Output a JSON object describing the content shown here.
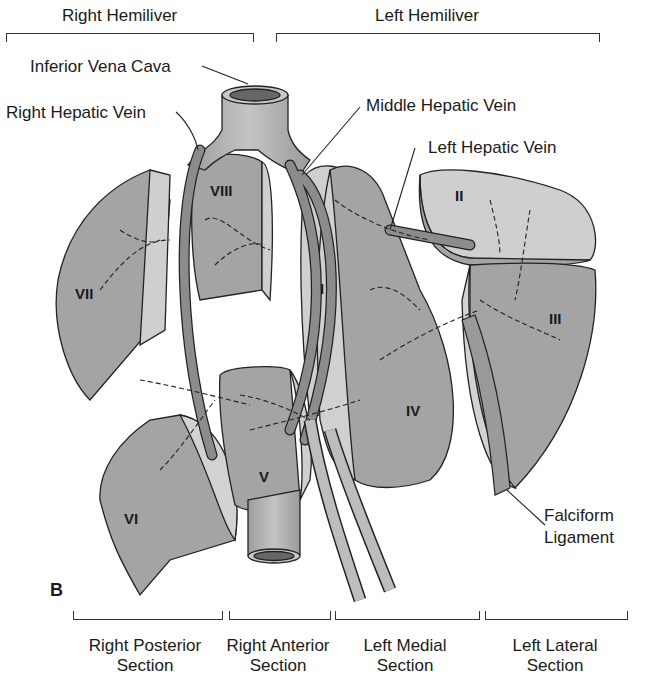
{
  "figure": {
    "panel_label": "B",
    "top_groups": [
      {
        "label": "Right Hemiliver"
      },
      {
        "label": "Left Hemiliver"
      }
    ],
    "bottom_sections": [
      {
        "line1": "Right Posterior",
        "line2": "Section"
      },
      {
        "line1": "Right Anterior",
        "line2": "Section"
      },
      {
        "line1": "Left Medial",
        "line2": "Section"
      },
      {
        "line1": "Left Lateral",
        "line2": "Section"
      }
    ],
    "callouts": {
      "ivc": "Inferior Vena Cava",
      "rhv": "Right Hepatic Vein",
      "mhv": "Middle Hepatic Vein",
      "lhv": "Left Hepatic Vein",
      "falciform_1": "Falciform",
      "falciform_2": "Ligament"
    },
    "segments": {
      "s1": "I",
      "s2": "II",
      "s3": "III",
      "s4": "IV",
      "s5": "V",
      "s6": "VI",
      "s7": "VII",
      "s8": "VIII"
    },
    "colors": {
      "lobe_dark": "#9a9a9a",
      "lobe_light": "#cfcfcf",
      "vessel": "#8c8c8c",
      "vessel_light": "#bdbdbd",
      "outline": "#222222"
    }
  }
}
